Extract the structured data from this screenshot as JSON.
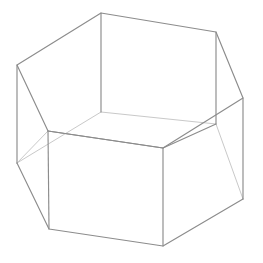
{
  "canvas": {
    "width": 263,
    "height": 263,
    "background_color": "#ffffff",
    "title": "Wireframe hexagonal prism"
  },
  "figure": {
    "name": "hexagonal-prism-wireframe",
    "style": {
      "visible_edge_color": "#8c8c8c",
      "hidden_edge_color": "#c9c9c9",
      "visible_edge_width": 1.15,
      "hidden_edge_width": 1,
      "face_fill_color": "#ffffff"
    },
    "vertices": {
      "top_rim": [
        {
          "id": "T0",
          "x": 101,
          "y": 13
        },
        {
          "id": "T1",
          "x": 216,
          "y": 32
        },
        {
          "id": "T2",
          "x": 243,
          "y": 98
        },
        {
          "id": "T3",
          "x": 163,
          "y": 148
        },
        {
          "id": "T4",
          "x": 48,
          "y": 131
        },
        {
          "id": "T5",
          "x": 17,
          "y": 65
        }
      ],
      "bottom_rim": [
        {
          "id": "B0",
          "x": 101,
          "y": 112
        },
        {
          "id": "B1",
          "x": 216,
          "y": 124
        },
        {
          "id": "B2",
          "x": 243,
          "y": 199
        },
        {
          "id": "B3",
          "x": 163,
          "y": 246
        },
        {
          "id": "B4",
          "x": 49,
          "y": 229
        },
        {
          "id": "B5",
          "x": 17,
          "y": 163
        }
      ]
    },
    "edges": {
      "top_rim_visible": "101,13 216,32 243,98 163,148 48,131 17,65 101,13",
      "bottom_rim_visible_front": "17,163 49,229 163,246 243,199",
      "bottom_rim_hidden_back": "17,163 101,112 216,124 243,199",
      "verticals_visible": [
        "101,13 101,112",
        "216,32 216,124",
        "243,98 243,199",
        "163,148 163,246",
        "48,131 49,229",
        "17,65 17,163"
      ],
      "inner_floor_visible": "48,131 163,148 216,124",
      "inner_floor_hidden": "48,131 17,163"
    },
    "faces": {
      "inner_floor": "101,112 216,124 163,246 49,229 17,163",
      "left_wall": "17,65 48,131 49,229 17,163",
      "front_wall": "48,131 163,148 163,246 49,229",
      "right_wall": "163,148 243,98 243,199 163,246"
    }
  }
}
